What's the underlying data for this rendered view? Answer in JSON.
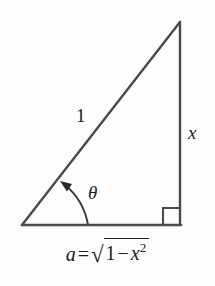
{
  "figure": {
    "type": "right-triangle-trig-diagram",
    "labels": {
      "hypotenuse": "1",
      "opposite_side": "x",
      "angle": "θ"
    },
    "caption": {
      "lhs_variable": "a",
      "equals": "=",
      "radical_symbol": "√",
      "radicand_first_term": "1",
      "radicand_operator": "−",
      "radicand_variable": "x",
      "radicand_exponent": "2",
      "full_text": "a = √(1 − x²)"
    },
    "geometry": {
      "apex": [
        180,
        22
      ],
      "bottom_right": [
        180,
        225
      ],
      "bottom_left": [
        22,
        225
      ],
      "right_angle_marker_size": 17,
      "angle_arc_radius": 66
    },
    "colors": {
      "stroke": "#4a4a4a",
      "text": "#1c1c1c",
      "background": "#fdfdfd"
    }
  }
}
